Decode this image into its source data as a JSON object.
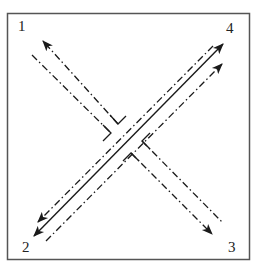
{
  "diagram": {
    "labels": {
      "p1": "1",
      "p2": "2",
      "p3": "3",
      "p4": "4"
    },
    "colors": {
      "stroke": "#1a1a1a",
      "frame": "#555555",
      "background": "#ffffff"
    },
    "lines": [
      {
        "id": "solid-2-4",
        "style": "solid",
        "from": "2",
        "to": "4",
        "arrows": "both"
      },
      {
        "id": "dashdot-upper-2-4",
        "style": "dash-dot",
        "arrow_at": "2"
      },
      {
        "id": "dashdot-lower-2-4",
        "style": "dash-dot",
        "arrow_at": "4"
      },
      {
        "id": "dashdot-upper-1-3",
        "style": "dash-dot",
        "arrow_at": "1",
        "broken_at_center": true
      },
      {
        "id": "dashdot-lower-1-3",
        "style": "dash-dot",
        "arrow_at": "3",
        "broken_at_center": true
      }
    ]
  }
}
